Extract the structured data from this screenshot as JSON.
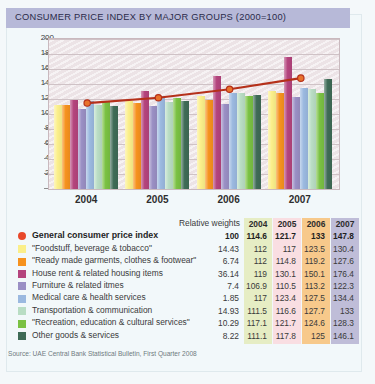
{
  "header": {
    "title": "CONSUMER PRICE INDEX BY MAJOR GROUPS (2000=100)",
    "bar_color": "#b7b9d8"
  },
  "chart_data": {
    "type": "bar",
    "title": "CONSUMER PRICE INDEX BY MAJOR GROUPS (2000=100)",
    "xlabel": "",
    "ylabel": "",
    "ylim": [
      0,
      200
    ],
    "yticks": [
      0,
      20,
      40,
      60,
      80,
      100,
      120,
      140,
      160,
      180,
      200
    ],
    "grid": true,
    "legend_position": "bottom-table",
    "categories": [
      "2004",
      "2005",
      "2006",
      "2007"
    ],
    "series": [
      {
        "name": "\"Foodstuff, beverage & tobacco\"",
        "color": "#fbef8a",
        "weight": "14.43",
        "values": [
          112,
          117,
          123.5,
          130.4
        ]
      },
      {
        "name": "\"Ready made garments, clothes & footwear\"",
        "color": "#f6921e",
        "weight": "6.74",
        "values": [
          112,
          114.8,
          119.2,
          127.6
        ]
      },
      {
        "name": "House rent & related housing items",
        "color": "#b4447d",
        "weight": "36.14",
        "values": [
          119,
          130.1,
          150.1,
          176.4
        ]
      },
      {
        "name": "Furniture & related itmes",
        "color": "#9a8fc4",
        "weight": "7.4",
        "values": [
          106.9,
          110.5,
          113.2,
          122.3
        ]
      },
      {
        "name": "Medical care & health services",
        "color": "#9bb9e0",
        "weight": "1.85",
        "values": [
          117,
          123.4,
          127.5,
          134.4
        ]
      },
      {
        "name": "Transportation & communication",
        "color": "#b9ddc4",
        "weight": "14.93",
        "values": [
          111.5,
          116.6,
          127.7,
          133
        ]
      },
      {
        "name": "\"Recreation, education & cultural services\"",
        "color": "#7ac143",
        "weight": "10.29",
        "values": [
          117.1,
          121.7,
          124.6,
          128.3
        ]
      },
      {
        "name": "Other goods & services",
        "color": "#3f6b56",
        "weight": "8.22",
        "values": [
          111.1,
          117.8,
          125,
          146.1
        ]
      }
    ],
    "line_series": {
      "name": "General consumer price index",
      "color": "#b5301a",
      "marker_color": "#e8722c",
      "weight": "100",
      "values": [
        114.6,
        121.7,
        133,
        147.8
      ]
    }
  },
  "table": {
    "header": {
      "weights_label": "Relative weights",
      "columns": [
        "2004",
        "2005",
        "2006",
        "2007"
      ],
      "column_colors": [
        "#e6edc4",
        "#f9dee2",
        "#f7c98b",
        "#bfbdd8"
      ]
    },
    "rows": [
      {
        "label": "General consumer price index",
        "swatch": "#e8482a",
        "shape": "dot",
        "weight": "100",
        "v": [
          "114.6",
          "121.7",
          "133",
          "147.8"
        ]
      },
      {
        "label": "\"Foodstuff, beverage & tobacco\"",
        "swatch": "#fbef8a",
        "shape": "square",
        "weight": "14.43",
        "v": [
          "112",
          "117",
          "123.5",
          "130.4"
        ]
      },
      {
        "label": "\"Ready made garments, clothes & footwear\"",
        "swatch": "#f6921e",
        "shape": "square",
        "weight": "6.74",
        "v": [
          "112",
          "114.8",
          "119.2",
          "127.6"
        ]
      },
      {
        "label": "House rent & related housing items",
        "swatch": "#b4447d",
        "shape": "square",
        "weight": "36.14",
        "v": [
          "119",
          "130.1",
          "150.1",
          "176.4"
        ]
      },
      {
        "label": "Furniture & related itmes",
        "swatch": "#9a8fc4",
        "shape": "square",
        "weight": "7.4",
        "v": [
          "106.9",
          "110.5",
          "113.2",
          "122.3"
        ]
      },
      {
        "label": "Medical care & health services",
        "swatch": "#9bb9e0",
        "shape": "square",
        "weight": "1.85",
        "v": [
          "117",
          "123.4",
          "127.5",
          "134.4"
        ]
      },
      {
        "label": "Transportation & communication",
        "swatch": "#b9ddc4",
        "shape": "square",
        "weight": "14.93",
        "v": [
          "111.5",
          "116.6",
          "127.7",
          "133"
        ]
      },
      {
        "label": "\"Recreation, education & cultural services\"",
        "swatch": "#7ac143",
        "shape": "square",
        "weight": "10.29",
        "v": [
          "117.1",
          "121.7",
          "124.6",
          "128.3"
        ]
      },
      {
        "label": "Other goods & services",
        "swatch": "#3f6b56",
        "shape": "square",
        "weight": "8.22",
        "v": [
          "111.1",
          "117.8",
          "125",
          "146.1"
        ]
      }
    ]
  },
  "source": "Source: UAE Central Bank Statistical Bulletin, First Quarter 2008"
}
